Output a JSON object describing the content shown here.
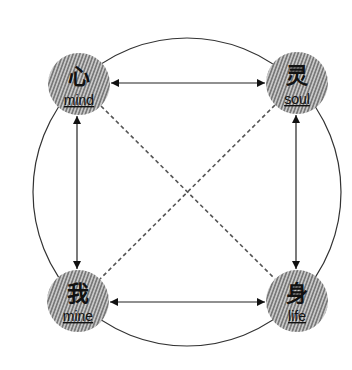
{
  "diagram": {
    "type": "concept-diagram",
    "outer_circle": {
      "cx": 187,
      "cy": 192,
      "r": 154,
      "stroke": "#333333"
    },
    "nodes": [
      {
        "id": "mind",
        "glyph": "心",
        "label": "mind",
        "cx": 79,
        "cy": 84,
        "r": 31
      },
      {
        "id": "soul",
        "glyph": "灵",
        "label": "soul",
        "cx": 297,
        "cy": 83,
        "r": 31
      },
      {
        "id": "mine",
        "glyph": "我",
        "label": "mine",
        "cx": 78,
        "cy": 301,
        "r": 31
      },
      {
        "id": "life",
        "glyph": "身",
        "label": "life",
        "cx": 297,
        "cy": 301,
        "r": 31
      }
    ],
    "edges": [
      {
        "from": "mind",
        "to": "soul",
        "style": "solid",
        "arrows": "both"
      },
      {
        "from": "mind",
        "to": "mine",
        "style": "solid",
        "arrows": "both"
      },
      {
        "from": "soul",
        "to": "life",
        "style": "solid",
        "arrows": "both"
      },
      {
        "from": "mine",
        "to": "life",
        "style": "solid",
        "arrows": "both"
      },
      {
        "from": "mind",
        "to": "life",
        "style": "dashed",
        "arrows": "none"
      },
      {
        "from": "soul",
        "to": "mine",
        "style": "dashed",
        "arrows": "none"
      }
    ],
    "colors": {
      "node_fill_dark": "#7a7a7a",
      "node_fill_light": "#c4c4c4",
      "line": "#222222",
      "dashed": "#555555"
    }
  }
}
